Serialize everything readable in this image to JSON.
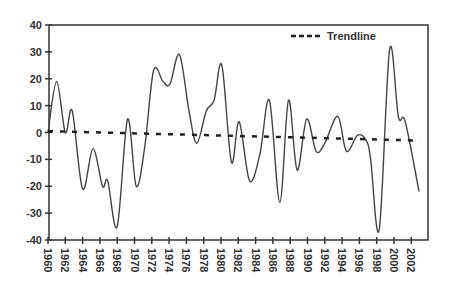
{
  "chart_data": {
    "type": "line",
    "title": "",
    "xlabel": "",
    "ylabel": "",
    "ylim": [
      -40,
      40
    ],
    "xlim": [
      1960,
      2003
    ],
    "grid": false,
    "legend_position": "top-right (inside plot)",
    "y_ticks": [
      40,
      30,
      20,
      10,
      0,
      -10,
      -20,
      -30,
      -40
    ],
    "x_tick_labels": [
      "1960",
      "1962",
      "1964",
      "1966",
      "1968",
      "1970",
      "1972",
      "1974",
      "1976",
      "1978",
      "1980",
      "1982",
      "1984",
      "1986",
      "1988",
      "1990",
      "1992",
      "1994",
      "1996",
      "1998",
      "2000",
      "2002"
    ],
    "series": [
      {
        "name": "Series",
        "style": "solid",
        "color": "#444444",
        "x": [
          1960,
          1961,
          1962,
          1962.8,
          1964,
          1965.2,
          1966.3,
          1966.9,
          1968,
          1969.2,
          1970.2,
          1971.2,
          1972.2,
          1973.3,
          1974.1,
          1975.2,
          1976.3,
          1977.2,
          1978.3,
          1979.2,
          1980.1,
          1981.2,
          1982.1,
          1983.3,
          1984.5,
          1985.6,
          1986.8,
          1987.8,
          1988.8,
          1989.9,
          1991,
          1992,
          1993.5,
          1994.5,
          1995.8,
          1996.8,
          1997.3,
          1998.3,
          1999.5,
          2000.5,
          2001.3,
          2002.9
        ],
        "values": [
          0,
          19,
          0,
          8,
          -21,
          -6,
          -20,
          -18,
          -35,
          5,
          -20,
          -5,
          23,
          19,
          18,
          29,
          8,
          -4,
          8,
          12,
          25,
          -11,
          4,
          -18,
          -8,
          12,
          -26,
          12,
          -14,
          5,
          -7,
          -4,
          6,
          -7,
          -1,
          -3,
          -10,
          -36,
          31,
          6,
          4,
          -22
        ]
      },
      {
        "name": "Trendline",
        "style": "dashed",
        "color": "#222222",
        "x": [
          1960,
          2003
        ],
        "values": [
          0.5,
          -3
        ]
      }
    ]
  },
  "legend": {
    "items": [
      {
        "label": "Trendline",
        "style": "dashed"
      }
    ]
  },
  "colors": {
    "line": "#444444",
    "trend": "#222222",
    "axis": "#333333",
    "background": "#ffffff"
  }
}
